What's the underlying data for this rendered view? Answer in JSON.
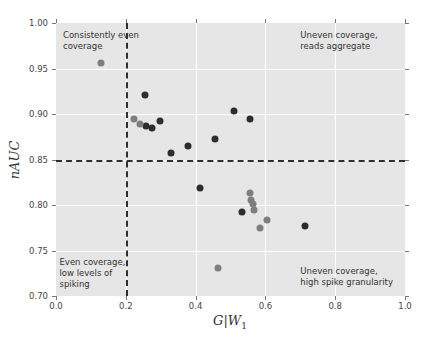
{
  "figure": {
    "background": "#ffffff",
    "plot_background": "#e6e6e6",
    "grid_color": "#ffffff",
    "tick_color": "#777777",
    "tick_label_color": "#444444",
    "annotation_color": "#333333",
    "refline_color": "#2f2f2f"
  },
  "chart_data": {
    "type": "scatter",
    "title": "",
    "xlabel": {
      "base": "G|W",
      "sub": "1"
    },
    "ylabel": "nAUC",
    "xlim": [
      0.0,
      1.0
    ],
    "ylim": [
      0.7,
      1.0
    ],
    "grid": true,
    "legend": false,
    "xticks": {
      "values": [
        0.0,
        0.2,
        0.4,
        0.6,
        0.8,
        1.0
      ],
      "labels": [
        "0.0",
        "0.2",
        "0.4",
        "0.6",
        "0.8",
        "1.0"
      ]
    },
    "yticks": {
      "values": [
        1.0,
        0.95,
        0.9,
        0.85,
        0.8,
        0.75,
        0.7
      ],
      "labels": [
        "1.00",
        "0.95",
        "0.90",
        "0.85",
        "0.80",
        "0.75",
        "0.70"
      ]
    },
    "reference_lines": [
      {
        "orientation": "vertical",
        "value": 0.2,
        "style": "dashed",
        "color": "#2f2f2f"
      },
      {
        "orientation": "horizontal",
        "value": 0.85,
        "style": "dashed",
        "color": "#2f2f2f"
      }
    ],
    "annotations": [
      {
        "name": "quadrant-label-top-left",
        "lines": [
          "Consistently even",
          "coverage"
        ],
        "x": 0.02,
        "y": 0.992
      },
      {
        "name": "quadrant-label-top-right",
        "lines": [
          "Uneven coverage,",
          "reads aggregate"
        ],
        "x": 0.7,
        "y": 0.992
      },
      {
        "name": "quadrant-label-bottom-left",
        "lines": [
          "Even coverage,",
          "low levels of",
          "spiking"
        ],
        "x": 0.01,
        "y": 0.743
      },
      {
        "name": "quadrant-label-bottom-right",
        "lines": [
          "Uneven coverage,",
          "high spike granularity"
        ],
        "x": 0.7,
        "y": 0.733
      }
    ],
    "series": [
      {
        "name": "dark-points",
        "color": "#2d2d2d",
        "marker": "circle",
        "points": [
          [
            0.255,
            0.921
          ],
          [
            0.258,
            0.887
          ],
          [
            0.275,
            0.885
          ],
          [
            0.298,
            0.892
          ],
          [
            0.33,
            0.857
          ],
          [
            0.378,
            0.865
          ],
          [
            0.456,
            0.872
          ],
          [
            0.51,
            0.903
          ],
          [
            0.556,
            0.895
          ],
          [
            0.413,
            0.819
          ],
          [
            0.533,
            0.792
          ],
          [
            0.713,
            0.777
          ]
        ]
      },
      {
        "name": "gray-points",
        "color": "#7e7e7e",
        "marker": "circle",
        "points": [
          [
            0.129,
            0.956
          ],
          [
            0.224,
            0.894
          ],
          [
            0.241,
            0.889
          ],
          [
            0.556,
            0.813
          ],
          [
            0.559,
            0.806
          ],
          [
            0.564,
            0.801
          ],
          [
            0.567,
            0.794
          ],
          [
            0.605,
            0.783
          ],
          [
            0.584,
            0.775
          ],
          [
            0.464,
            0.731
          ]
        ]
      }
    ]
  }
}
